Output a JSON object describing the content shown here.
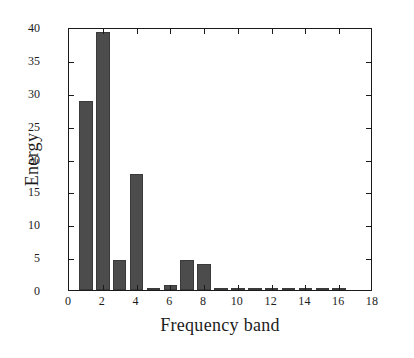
{
  "chart_data": {
    "type": "bar",
    "title": "",
    "xlabel": "Frequency band",
    "ylabel": "Energy",
    "xlim": [
      0,
      18
    ],
    "ylim": [
      0,
      40
    ],
    "xticks": [
      0,
      2,
      4,
      6,
      8,
      10,
      12,
      14,
      16,
      18
    ],
    "xticklabels": [
      "0",
      "2",
      "4",
      "6",
      "8",
      "10",
      "12",
      "14",
      "16",
      "18"
    ],
    "yticks": [
      0,
      5,
      10,
      15,
      20,
      25,
      30,
      35,
      40
    ],
    "yticklabels": [
      "0",
      "5",
      "10",
      "15",
      "20",
      "25",
      "30",
      "35",
      "40"
    ],
    "grid": false,
    "legend": false,
    "bar_color": "#4c4c4c",
    "bar_edge_color": "#3a3a3a",
    "axis_color": "#1a1a1a",
    "bar_width": 0.8,
    "categories": [
      1,
      2,
      3,
      4,
      5,
      6,
      7,
      8,
      9,
      10,
      11,
      12,
      13,
      14,
      15,
      16
    ],
    "values": [
      28.7,
      39.3,
      4.5,
      17.6,
      0.2,
      0.7,
      4.5,
      4.0,
      0.05,
      0.1,
      0.05,
      0.1,
      0.2,
      0.2,
      0.05,
      0.3
    ]
  }
}
